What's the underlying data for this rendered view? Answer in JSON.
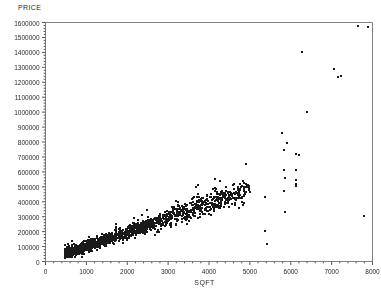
{
  "chart_data": {
    "type": "scatter",
    "title": "",
    "ylabel": "PRICE",
    "xlabel": "SQFT",
    "xlim": [
      0,
      8000
    ],
    "ylim": [
      0,
      1600000
    ],
    "grid": false,
    "legend": null,
    "x_ticks": [
      0,
      1000,
      2000,
      3000,
      4000,
      5000,
      6000,
      7000,
      8000
    ],
    "y_ticks": [
      0,
      100000,
      200000,
      300000,
      400000,
      500000,
      600000,
      700000,
      800000,
      900000,
      1000000,
      1100000,
      1200000,
      1300000,
      1400000,
      1500000,
      1600000
    ],
    "x_tick_labels": [
      "0",
      "1000",
      "2000",
      "3000",
      "4000",
      "5000",
      "6000",
      "7000",
      "8000"
    ],
    "y_tick_labels": [
      "0",
      "100000",
      "200000",
      "300000",
      "400000",
      "500000",
      "600000",
      "700000",
      "800000",
      "900000",
      "1000000",
      "1100000",
      "1200000",
      "1300000",
      "1400000",
      "1500000",
      "1600000"
    ],
    "minor_ticks_per_interval": 5,
    "marker": "square",
    "marker_size_px": 2,
    "marker_color": "#1a1a1a",
    "axis_color": "#808080",
    "background": "#ffffff",
    "outliers": [
      {
        "x": 7650,
        "y": 1575000
      },
      {
        "x": 7880,
        "y": 1570000
      },
      {
        "x": 6280,
        "y": 1400000
      },
      {
        "x": 7060,
        "y": 1290000
      },
      {
        "x": 7230,
        "y": 1245000
      },
      {
        "x": 7150,
        "y": 1235000
      },
      {
        "x": 6390,
        "y": 1000000
      },
      {
        "x": 5780,
        "y": 860000
      },
      {
        "x": 5920,
        "y": 790000
      },
      {
        "x": 5840,
        "y": 745000
      },
      {
        "x": 6140,
        "y": 720000
      },
      {
        "x": 6190,
        "y": 712000
      },
      {
        "x": 5830,
        "y": 615000
      },
      {
        "x": 6120,
        "y": 612000
      },
      {
        "x": 5870,
        "y": 560000
      },
      {
        "x": 6120,
        "y": 545000
      },
      {
        "x": 6130,
        "y": 520000
      },
      {
        "x": 6130,
        "y": 505000
      },
      {
        "x": 5840,
        "y": 470000
      },
      {
        "x": 5370,
        "y": 430000
      },
      {
        "x": 5870,
        "y": 330000
      },
      {
        "x": 7790,
        "y": 305000
      },
      {
        "x": 5360,
        "y": 205000
      },
      {
        "x": 5410,
        "y": 118000
      }
    ],
    "main_cluster": {
      "description": "Dense positively-sloped band of residential listings from ~500 to ~5000 SQFT",
      "n_points": 900,
      "x_range": [
        480,
        5000
      ],
      "y_range": [
        30000,
        560000
      ],
      "trend_slope": 95,
      "trend_intercept": 5000,
      "spread_base": 16000,
      "spread_growth": 0.042
    }
  }
}
